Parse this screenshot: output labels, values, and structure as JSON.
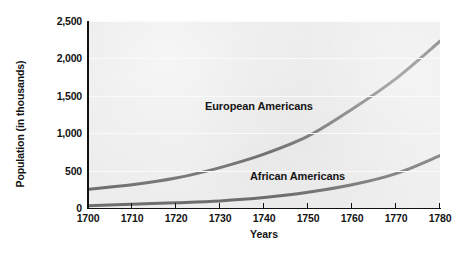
{
  "chart_data": {
    "type": "line",
    "title": "",
    "xlabel": "Years",
    "ylabel": "Population (in thousands)",
    "x": [
      1700,
      1710,
      1720,
      1730,
      1740,
      1750,
      1760,
      1770,
      1780
    ],
    "xtick_labels": [
      "1700",
      "1710",
      "1720",
      "1730",
      "1740",
      "1750",
      "1760",
      "1770",
      "1780"
    ],
    "ytick_labels": [
      "0",
      "500",
      "1,000",
      "1,500",
      "2,000",
      "2,500"
    ],
    "yticks": [
      0,
      500,
      1000,
      1500,
      2000,
      2500
    ],
    "xlim": [
      1700,
      1780
    ],
    "ylim": [
      0,
      2500
    ],
    "grid": "horizontal",
    "legend_position": "inline-annotations",
    "plot_background_color": "#ededed",
    "line_color": "#6e6e6e",
    "series": [
      {
        "name": "European Americans",
        "label": "European Americans",
        "values": [
          250,
          310,
          400,
          540,
          720,
          960,
          1320,
          1730,
          2230
        ]
      },
      {
        "name": "African Americans",
        "label": "African Americans",
        "values": [
          30,
          50,
          70,
          95,
          140,
          210,
          310,
          460,
          700
        ]
      }
    ]
  },
  "annotations": {
    "european_label": "European Americans",
    "african_label": "African Americans"
  },
  "axes": {
    "x_title": "Years",
    "y_title": "Population (in thousands)"
  }
}
